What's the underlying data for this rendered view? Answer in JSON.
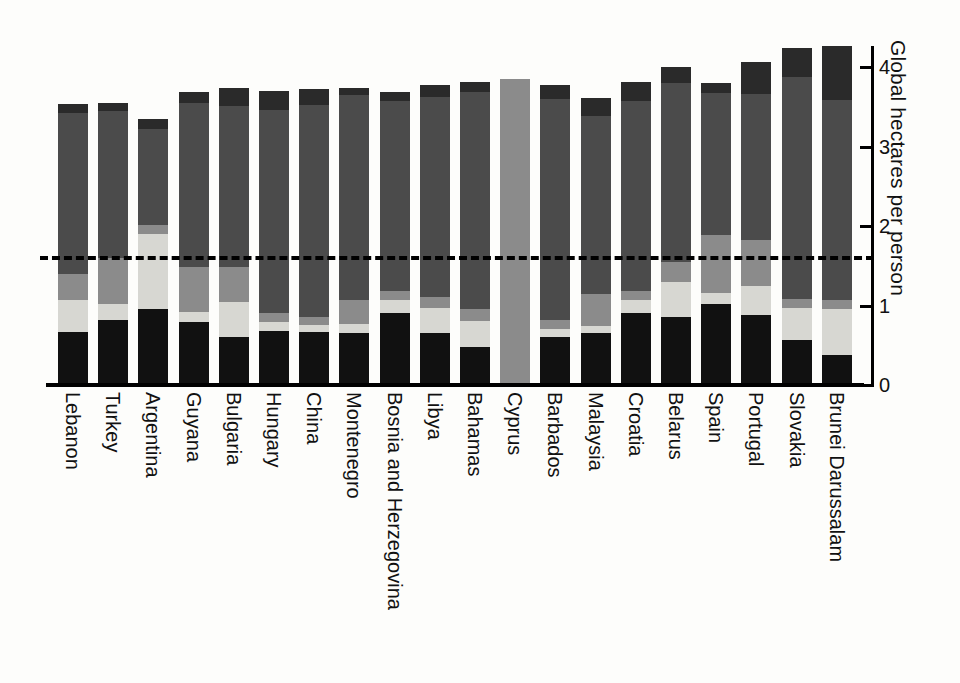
{
  "chart_data": {
    "type": "bar",
    "stacked": true,
    "title": "",
    "subtitle": "",
    "xlabel": "",
    "ylabel": "Global hectares per person",
    "ylim": [
      0,
      4.3
    ],
    "yticks": [
      0,
      1,
      2,
      3,
      4
    ],
    "ytick_labels": [
      "0",
      "1",
      "2",
      "3",
      "4"
    ],
    "grid": false,
    "legend": "none",
    "annotations": [
      {
        "name": "world-biocapacity-threshold",
        "type": "hline",
        "value": 1.62,
        "style": "dashed",
        "color": "#000000",
        "label": ""
      }
    ],
    "categories": [
      "Lebanon",
      "Turkey",
      "Argentina",
      "Guyana",
      "Bulgaria",
      "Hungary",
      "China",
      "Montenegro",
      "Bosnia and Herzegovina",
      "Libya",
      "Bahamas",
      "Cyprus",
      "Barbados",
      "Malaysia",
      "Croatia",
      "Belarus",
      "Spain",
      "Portugal",
      "Slovakia",
      "Brunei Darussalam"
    ],
    "series": [
      {
        "name": "built-up-land",
        "color": "#111111",
        "values": [
          0.67,
          0.82,
          0.95,
          0.79,
          0.6,
          0.68,
          0.67,
          0.66,
          0.9,
          0.66,
          0.48,
          0.0,
          0.6,
          0.66,
          0.9,
          0.85,
          1.02,
          0.88,
          0.56,
          0.38
        ]
      },
      {
        "name": "cropland",
        "color": "#d7d7d2",
        "values": [
          0.4,
          0.2,
          0.95,
          0.13,
          0.45,
          0.11,
          0.08,
          0.11,
          0.17,
          0.31,
          0.32,
          0.0,
          0.11,
          0.08,
          0.17,
          0.45,
          0.14,
          0.36,
          0.41,
          0.58
        ]
      },
      {
        "name": "grazing-land",
        "color": "#8b8b8b",
        "values": [
          0.33,
          0.58,
          0.11,
          0.57,
          0.43,
          0.11,
          0.11,
          0.3,
          0.11,
          0.14,
          0.15,
          3.85,
          0.11,
          0.4,
          0.11,
          0.25,
          0.73,
          0.58,
          0.11,
          0.11
        ]
      },
      {
        "name": "forest-and-fishing-grounds",
        "color": "#4b4b4b",
        "values": [
          2.02,
          1.85,
          1.21,
          2.06,
          2.03,
          2.56,
          2.66,
          2.58,
          2.39,
          2.51,
          2.74,
          0.0,
          2.78,
          2.24,
          2.39,
          2.25,
          1.78,
          1.84,
          2.8,
          2.52
        ]
      },
      {
        "name": "carbon-footprint-top",
        "color": "#2a2a2a",
        "values": [
          0.12,
          0.1,
          0.13,
          0.13,
          0.22,
          0.24,
          0.2,
          0.09,
          0.11,
          0.16,
          0.12,
          0.0,
          0.17,
          0.23,
          0.24,
          0.2,
          0.13,
          0.4,
          0.36,
          0.67
        ]
      }
    ]
  },
  "axis": {
    "y_title": "Global hectares per person"
  }
}
